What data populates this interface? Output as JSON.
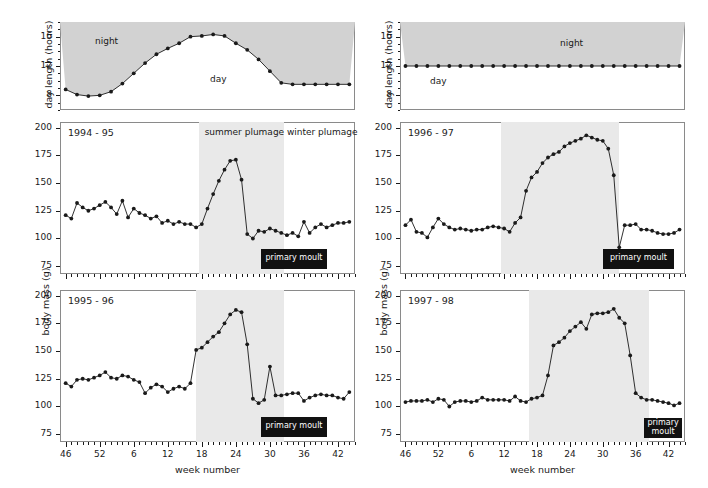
{
  "figure": {
    "xaxis_title": "week number",
    "yaxis_title_top": "day length (hours)",
    "yaxis_title_mass": "body mass (g)",
    "week_tick_labels": [
      "46",
      "52",
      "6",
      "12",
      "18",
      "24",
      "30",
      "36",
      "42"
    ],
    "week_tick_values": [
      46,
      52,
      58,
      64,
      70,
      76,
      82,
      88,
      94
    ],
    "week_range": [
      45,
      97
    ],
    "daylength_ticks": [
      8,
      12,
      16
    ],
    "daylength_range": [
      6,
      18
    ],
    "mass_ticks": [
      75,
      100,
      125,
      150,
      175,
      200
    ],
    "mass_range": [
      68,
      205
    ],
    "labels": {
      "night": "night",
      "day": "day",
      "summer_plumage": "summer plumage",
      "winter_plumage": "winter plumage",
      "primary_moult": "primary moult"
    },
    "colors": {
      "night_fill": "#d2d2d2",
      "season_fill": "#e9e9e9",
      "moult_bar": "#111111",
      "line": "#1a1a1a",
      "frame": "#8a8a8a"
    }
  },
  "chart_data": [
    {
      "id": "daylength-natural",
      "type": "line",
      "title": "",
      "xlabel": "week number",
      "ylabel": "day length (hours)",
      "ylim": [
        6,
        18
      ],
      "xlim": [
        45,
        97
      ],
      "grid": false,
      "annotations": [
        "night",
        "day"
      ],
      "x": [
        46,
        48,
        50,
        52,
        54,
        56,
        58,
        60,
        62,
        64,
        66,
        68,
        70,
        72,
        74,
        76,
        78,
        80,
        82,
        84,
        86,
        88,
        90,
        92,
        94,
        96
      ],
      "values": [
        8.8,
        8.1,
        7.9,
        8.0,
        8.5,
        9.6,
        11.0,
        12.4,
        13.6,
        14.4,
        15.1,
        16.0,
        16.1,
        16.3,
        16.1,
        15.1,
        14.2,
        12.9,
        11.3,
        9.7,
        9.5,
        9.5,
        9.5,
        9.5,
        9.5,
        9.5
      ]
    },
    {
      "id": "daylength-constant",
      "type": "line",
      "title": "",
      "xlabel": "week number",
      "ylabel": "day length (hours)",
      "ylim": [
        6,
        18
      ],
      "xlim": [
        45,
        97
      ],
      "grid": false,
      "annotations": [
        "night",
        "day"
      ],
      "x": [
        46,
        48,
        50,
        52,
        54,
        56,
        58,
        60,
        62,
        64,
        66,
        68,
        70,
        72,
        74,
        76,
        78,
        80,
        82,
        84,
        86,
        88,
        90,
        92,
        94,
        96
      ],
      "values": [
        12,
        12,
        12,
        12,
        12,
        12,
        12,
        12,
        12,
        12,
        12,
        12,
        12,
        12,
        12,
        12,
        12,
        12,
        12,
        12,
        12,
        12,
        12,
        12,
        12,
        12
      ]
    },
    {
      "id": "body-mass-1994-95",
      "type": "line",
      "title": "1994 - 95",
      "xlabel": "week number",
      "ylabel": "body mass (g)",
      "ylim": [
        68,
        205
      ],
      "xlim": [
        45,
        97
      ],
      "grid": false,
      "season_band": {
        "label": "summer plumage",
        "start": 69.5,
        "end": 84.5
      },
      "moult_bar": {
        "label": "primary moult",
        "start": 80.5,
        "end": 92.0,
        "y": 80
      },
      "x": [
        46,
        47,
        48,
        49,
        50,
        51,
        52,
        53,
        54,
        55,
        56,
        57,
        58,
        59,
        60,
        61,
        62,
        63,
        64,
        65,
        66,
        67,
        68,
        69,
        70,
        71,
        72,
        73,
        74,
        75,
        76,
        77,
        78,
        79,
        80,
        81,
        82,
        83,
        84,
        85,
        86,
        87,
        88,
        89,
        90,
        91,
        92,
        93,
        94,
        95,
        96
      ],
      "values": [
        121,
        118,
        132,
        128,
        125,
        127,
        130,
        133,
        128,
        122,
        134,
        119,
        127,
        123,
        121,
        118,
        120,
        114,
        116,
        113,
        115,
        113,
        113,
        110,
        113,
        127,
        140,
        152,
        162,
        170,
        171,
        153,
        104,
        100,
        107,
        106,
        109,
        107,
        105,
        103,
        105,
        102,
        115,
        105,
        110,
        113,
        110,
        112,
        114,
        114,
        115
      ]
    },
    {
      "id": "body-mass-1995-96",
      "type": "line",
      "title": "1995 - 96",
      "xlabel": "week number",
      "ylabel": "body mass (g)",
      "ylim": [
        68,
        205
      ],
      "xlim": [
        45,
        97
      ],
      "grid": false,
      "season_band": {
        "label": "summer plumage",
        "start": 69.0,
        "end": 84.5
      },
      "moult_bar": {
        "label": "primary moult",
        "start": 80.5,
        "end": 92.0,
        "y": 80
      },
      "x": [
        46,
        47,
        48,
        49,
        50,
        51,
        52,
        53,
        54,
        55,
        56,
        57,
        58,
        59,
        60,
        61,
        62,
        63,
        64,
        65,
        66,
        67,
        68,
        69,
        70,
        71,
        72,
        73,
        74,
        75,
        76,
        77,
        78,
        79,
        80,
        81,
        82,
        83,
        84,
        85,
        86,
        87,
        88,
        89,
        90,
        91,
        92,
        93,
        94,
        95,
        96
      ],
      "values": [
        121,
        118,
        124,
        125,
        124,
        126,
        128,
        131,
        126,
        125,
        128,
        127,
        124,
        122,
        112,
        117,
        120,
        118,
        113,
        116,
        118,
        116,
        121,
        151,
        153,
        158,
        163,
        167,
        175,
        183,
        187,
        185,
        156,
        107,
        103,
        106,
        136,
        110,
        110,
        111,
        112,
        112,
        105,
        108,
        110,
        111,
        110,
        110,
        108,
        107,
        113
      ]
    },
    {
      "id": "body-mass-1996-97",
      "type": "line",
      "title": "1996 - 97",
      "xlabel": "week number",
      "ylabel": "body mass (g)",
      "ylim": [
        68,
        205
      ],
      "xlim": [
        45,
        97
      ],
      "grid": false,
      "season_band": {
        "label": "summer plumage",
        "start": 63.5,
        "end": 85.0
      },
      "moult_bar": {
        "label": "primary moult",
        "start": 82.0,
        "end": 95.0,
        "y": 80
      },
      "x": [
        46,
        47,
        48,
        49,
        50,
        51,
        52,
        53,
        54,
        55,
        56,
        57,
        58,
        59,
        60,
        61,
        62,
        63,
        64,
        65,
        66,
        67,
        68,
        69,
        70,
        71,
        72,
        73,
        74,
        75,
        76,
        77,
        78,
        79,
        80,
        81,
        82,
        83,
        84,
        85,
        86,
        87,
        88,
        89,
        90,
        91,
        92,
        93,
        94,
        95,
        96
      ],
      "values": [
        112,
        117,
        106,
        105,
        101,
        110,
        118,
        113,
        110,
        108,
        109,
        108,
        107,
        108,
        108,
        110,
        111,
        110,
        109,
        106,
        114,
        119,
        143,
        155,
        160,
        168,
        173,
        176,
        178,
        183,
        186,
        188,
        190,
        193,
        191,
        189,
        188,
        181,
        157,
        92,
        112,
        112,
        113,
        108,
        108,
        107,
        105,
        104,
        104,
        105,
        108
      ]
    },
    {
      "id": "body-mass-1997-98",
      "type": "line",
      "title": "1997 - 98",
      "xlabel": "week number",
      "ylabel": "body mass (g)",
      "ylim": [
        68,
        205
      ],
      "xlim": [
        45,
        97
      ],
      "grid": false,
      "season_band": {
        "label": "summer plumage",
        "start": 68.5,
        "end": 90.5
      },
      "moult_bar": {
        "label": "primary moult",
        "start": 89.5,
        "end": 96.5,
        "y": 79
      },
      "x": [
        46,
        47,
        48,
        49,
        50,
        51,
        52,
        53,
        54,
        55,
        56,
        57,
        58,
        59,
        60,
        61,
        62,
        63,
        64,
        65,
        66,
        67,
        68,
        69,
        70,
        71,
        72,
        73,
        74,
        75,
        76,
        77,
        78,
        79,
        80,
        81,
        82,
        83,
        84,
        85,
        86,
        87,
        88,
        89,
        90,
        91,
        92,
        93,
        94,
        95,
        96
      ],
      "values": [
        104,
        105,
        105,
        105,
        106,
        104,
        107,
        106,
        100,
        104,
        105,
        105,
        104,
        105,
        108,
        106,
        106,
        106,
        106,
        105,
        109,
        105,
        104,
        107,
        108,
        110,
        128,
        155,
        158,
        162,
        168,
        172,
        176,
        170,
        183,
        184,
        184,
        185,
        188,
        180,
        175,
        146,
        112,
        108,
        106,
        106,
        105,
        104,
        103,
        101,
        103
      ]
    }
  ]
}
